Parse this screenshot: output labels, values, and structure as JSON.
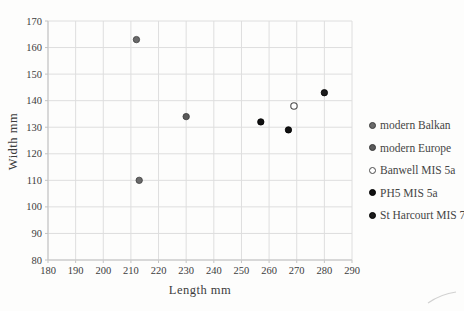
{
  "chart_data": {
    "type": "scatter",
    "title": "",
    "xlabel": "Length mm",
    "ylabel": "Width mm",
    "xlim": [
      180,
      290
    ],
    "ylim": [
      80,
      170
    ],
    "xticks": [
      180,
      190,
      200,
      210,
      220,
      230,
      240,
      250,
      260,
      270,
      280,
      290
    ],
    "yticks": [
      80,
      90,
      100,
      110,
      120,
      130,
      140,
      150,
      160,
      170
    ],
    "grid": true,
    "legend_position": "right",
    "series": [
      {
        "name": "modern Balkan",
        "marker": "filled",
        "color": "#6a6a6a",
        "edge": "#3d3d3d",
        "points": [
          [
            212,
            163
          ],
          [
            213,
            110
          ]
        ]
      },
      {
        "name": "modern Europe",
        "marker": "filled",
        "color": "#5a5a5a",
        "edge": "#383838",
        "points": [
          [
            230,
            134
          ]
        ]
      },
      {
        "name": "Banwell MIS 5a",
        "marker": "open",
        "color": "#ffffff",
        "edge": "#4a4a4a",
        "points": [
          [
            269,
            138
          ]
        ]
      },
      {
        "name": "PH5 MIS 5a",
        "marker": "filled",
        "color": "#111111",
        "edge": "#000000",
        "points": [
          [
            257,
            132
          ],
          [
            267,
            129
          ]
        ]
      },
      {
        "name": "St Harcourt MIS 7",
        "marker": "filled",
        "color": "#1c1c1c",
        "edge": "#000000",
        "points": [
          [
            280,
            143
          ]
        ]
      }
    ],
    "colors": {
      "grid": "#dedede",
      "axis": "#c3c3c3",
      "tick_text": "#3c3c3c"
    }
  }
}
